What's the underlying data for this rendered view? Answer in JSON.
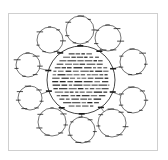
{
  "diagram": {
    "type": "radial-concept-map",
    "colors": {
      "ink": "#1a1a1a",
      "frame": "#cfcfcf",
      "background": "#ffffff"
    },
    "center": {
      "cx": 81,
      "cy": 80,
      "r": 34,
      "text_lines": 16,
      "legible": false
    },
    "satellites": [
      {
        "id": "top",
        "cx": 80,
        "cy": 30,
        "r": 14
      },
      {
        "id": "top-right",
        "cx": 108,
        "cy": 38,
        "r": 13
      },
      {
        "id": "right-upper",
        "cx": 133,
        "cy": 62,
        "r": 13
      },
      {
        "id": "right-lower",
        "cx": 133,
        "cy": 100,
        "r": 13
      },
      {
        "id": "bottom-right",
        "cx": 112,
        "cy": 123,
        "r": 14
      },
      {
        "id": "bottom",
        "cx": 82,
        "cy": 130,
        "r": 13
      },
      {
        "id": "bottom-left",
        "cx": 52,
        "cy": 122,
        "r": 14
      },
      {
        "id": "left-lower",
        "cx": 30,
        "cy": 98,
        "r": 12
      },
      {
        "id": "left-upper",
        "cx": 28,
        "cy": 65,
        "r": 12
      },
      {
        "id": "top-left",
        "cx": 50,
        "cy": 40,
        "r": 13
      }
    ]
  }
}
